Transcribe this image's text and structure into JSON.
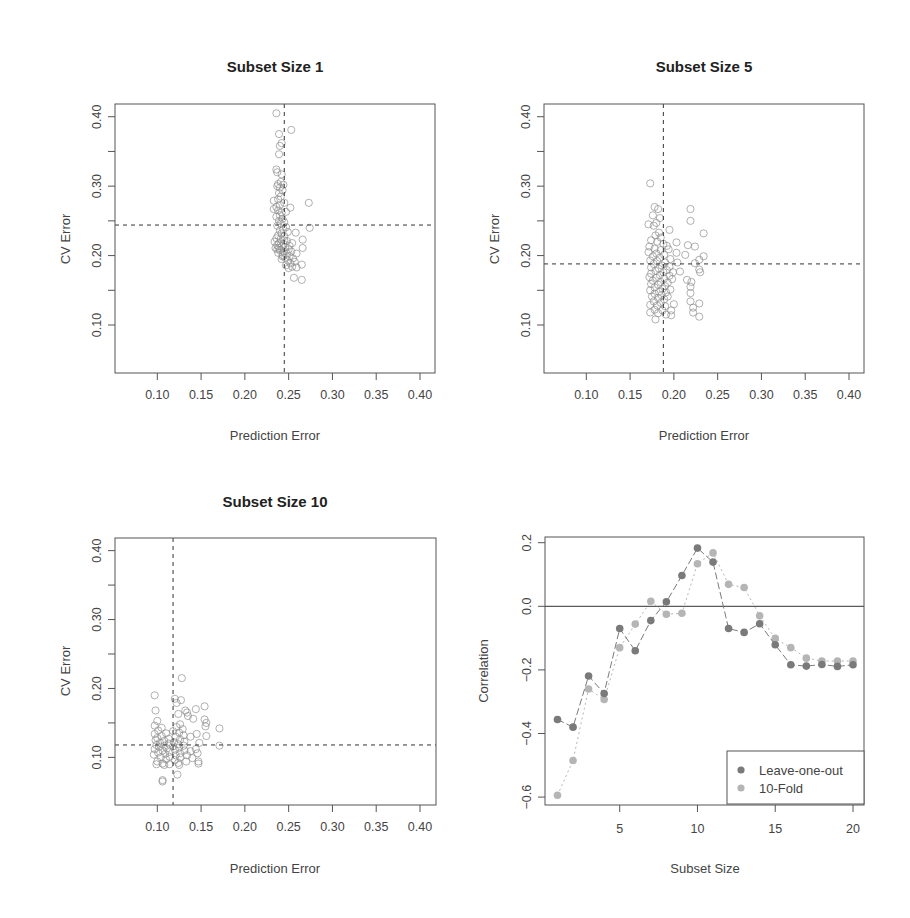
{
  "chart_data": [
    {
      "type": "scatter",
      "title": "Subset Size 1",
      "xlabel": "Prediction Error",
      "ylabel": "CV Error",
      "xlim": [
        0.05,
        0.42
      ],
      "ylim": [
        0.05,
        0.42
      ],
      "xticks": [
        "0.10",
        "0.15",
        "0.20",
        "0.25",
        "0.30",
        "0.35",
        "0.40"
      ],
      "yticks": [
        "0.10",
        "0.20",
        "0.30",
        "0.40"
      ],
      "grid": false,
      "marker": "open-circle",
      "reference_lines": {
        "vertical": 0.245,
        "horizontal": 0.244,
        "style": "dashed"
      },
      "cluster": {
        "x_center": 0.243,
        "y_range": [
          0.16,
          0.405
        ],
        "note": "~100 points concentrated near x=0.24-0.26"
      },
      "points": [
        [
          0.236,
          0.405
        ],
        [
          0.253,
          0.381
        ],
        [
          0.239,
          0.375
        ],
        [
          0.242,
          0.362
        ],
        [
          0.24,
          0.358
        ],
        [
          0.239,
          0.346
        ],
        [
          0.236,
          0.324
        ],
        [
          0.237,
          0.32
        ],
        [
          0.242,
          0.317
        ],
        [
          0.241,
          0.306
        ],
        [
          0.238,
          0.303
        ],
        [
          0.244,
          0.302
        ],
        [
          0.237,
          0.3
        ],
        [
          0.24,
          0.298
        ],
        [
          0.243,
          0.294
        ],
        [
          0.239,
          0.29
        ],
        [
          0.241,
          0.285
        ],
        [
          0.238,
          0.281
        ],
        [
          0.233,
          0.279
        ],
        [
          0.273,
          0.276
        ],
        [
          0.245,
          0.276
        ],
        [
          0.24,
          0.273
        ],
        [
          0.236,
          0.27
        ],
        [
          0.252,
          0.269
        ],
        [
          0.233,
          0.267
        ],
        [
          0.238,
          0.265
        ],
        [
          0.242,
          0.262
        ],
        [
          0.247,
          0.263
        ],
        [
          0.24,
          0.258
        ],
        [
          0.236,
          0.256
        ],
        [
          0.243,
          0.253
        ],
        [
          0.239,
          0.25
        ],
        [
          0.245,
          0.248
        ],
        [
          0.241,
          0.246
        ],
        [
          0.237,
          0.243
        ],
        [
          0.247,
          0.241
        ],
        [
          0.274,
          0.24
        ],
        [
          0.244,
          0.238
        ],
        [
          0.24,
          0.236
        ],
        [
          0.258,
          0.233
        ],
        [
          0.249,
          0.234
        ],
        [
          0.242,
          0.232
        ],
        [
          0.238,
          0.229
        ],
        [
          0.245,
          0.228
        ],
        [
          0.236,
          0.225
        ],
        [
          0.241,
          0.224
        ],
        [
          0.266,
          0.223
        ],
        [
          0.248,
          0.221
        ],
        [
          0.234,
          0.22
        ],
        [
          0.239,
          0.218
        ],
        [
          0.244,
          0.217
        ],
        [
          0.254,
          0.218
        ],
        [
          0.237,
          0.215
        ],
        [
          0.242,
          0.213
        ],
        [
          0.246,
          0.212
        ],
        [
          0.266,
          0.211
        ],
        [
          0.235,
          0.211
        ],
        [
          0.25,
          0.209
        ],
        [
          0.24,
          0.208
        ],
        [
          0.244,
          0.206
        ],
        [
          0.253,
          0.206
        ],
        [
          0.238,
          0.204
        ],
        [
          0.248,
          0.203
        ],
        [
          0.259,
          0.203
        ],
        [
          0.243,
          0.201
        ],
        [
          0.251,
          0.199
        ],
        [
          0.246,
          0.197
        ],
        [
          0.255,
          0.196
        ],
        [
          0.242,
          0.195
        ],
        [
          0.249,
          0.193
        ],
        [
          0.257,
          0.191
        ],
        [
          0.252,
          0.189
        ],
        [
          0.265,
          0.187
        ],
        [
          0.247,
          0.186
        ],
        [
          0.254,
          0.184
        ],
        [
          0.259,
          0.183
        ],
        [
          0.25,
          0.182
        ],
        [
          0.256,
          0.168
        ],
        [
          0.265,
          0.165
        ],
        [
          0.245,
          0.222
        ],
        [
          0.239,
          0.211
        ],
        [
          0.251,
          0.214
        ],
        [
          0.237,
          0.209
        ],
        [
          0.243,
          0.199
        ]
      ]
    },
    {
      "type": "scatter",
      "title": "Subset Size 5",
      "xlabel": "Prediction Error",
      "ylabel": "CV Error",
      "xlim": [
        0.05,
        0.42
      ],
      "ylim": [
        0.05,
        0.42
      ],
      "xticks": [
        "0.10",
        "0.15",
        "0.20",
        "0.25",
        "0.30",
        "0.35",
        "0.40"
      ],
      "yticks": [
        "0.10",
        "0.20",
        "0.30",
        "0.40"
      ],
      "grid": false,
      "marker": "open-circle",
      "reference_lines": {
        "vertical": 0.188,
        "horizontal": 0.188,
        "style": "dashed"
      },
      "cluster": {
        "x_range": [
          0.17,
          0.235
        ],
        "y_range": [
          0.108,
          0.304
        ]
      },
      "points": [
        [
          0.173,
          0.304
        ],
        [
          0.178,
          0.27
        ],
        [
          0.182,
          0.267
        ],
        [
          0.219,
          0.267
        ],
        [
          0.176,
          0.258
        ],
        [
          0.184,
          0.254
        ],
        [
          0.219,
          0.25
        ],
        [
          0.171,
          0.245
        ],
        [
          0.18,
          0.247
        ],
        [
          0.177,
          0.243
        ],
        [
          0.195,
          0.237
        ],
        [
          0.183,
          0.233
        ],
        [
          0.234,
          0.232
        ],
        [
          0.179,
          0.229
        ],
        [
          0.185,
          0.226
        ],
        [
          0.174,
          0.222
        ],
        [
          0.181,
          0.22
        ],
        [
          0.203,
          0.219
        ],
        [
          0.188,
          0.217
        ],
        [
          0.216,
          0.215
        ],
        [
          0.224,
          0.213
        ],
        [
          0.172,
          0.213
        ],
        [
          0.192,
          0.214
        ],
        [
          0.178,
          0.21
        ],
        [
          0.185,
          0.208
        ],
        [
          0.194,
          0.209
        ],
        [
          0.171,
          0.205
        ],
        [
          0.203,
          0.204
        ],
        [
          0.18,
          0.203
        ],
        [
          0.189,
          0.201
        ],
        [
          0.213,
          0.201
        ],
        [
          0.176,
          0.199
        ],
        [
          0.234,
          0.199
        ],
        [
          0.184,
          0.197
        ],
        [
          0.196,
          0.195
        ],
        [
          0.173,
          0.193
        ],
        [
          0.229,
          0.194
        ],
        [
          0.181,
          0.192
        ],
        [
          0.19,
          0.19
        ],
        [
          0.204,
          0.19
        ],
        [
          0.177,
          0.188
        ],
        [
          0.224,
          0.189
        ],
        [
          0.186,
          0.186
        ],
        [
          0.195,
          0.184
        ],
        [
          0.174,
          0.183
        ],
        [
          0.183,
          0.181
        ],
        [
          0.192,
          0.179
        ],
        [
          0.229,
          0.18
        ],
        [
          0.179,
          0.178
        ],
        [
          0.207,
          0.177
        ],
        [
          0.188,
          0.176
        ],
        [
          0.199,
          0.176
        ],
        [
          0.23,
          0.176
        ],
        [
          0.174,
          0.174
        ],
        [
          0.184,
          0.172
        ],
        [
          0.195,
          0.171
        ],
        [
          0.172,
          0.169
        ],
        [
          0.18,
          0.168
        ],
        [
          0.189,
          0.167
        ],
        [
          0.198,
          0.166
        ],
        [
          0.215,
          0.165
        ],
        [
          0.176,
          0.164
        ],
        [
          0.185,
          0.162
        ],
        [
          0.22,
          0.162
        ],
        [
          0.193,
          0.161
        ],
        [
          0.174,
          0.159
        ],
        [
          0.182,
          0.158
        ],
        [
          0.19,
          0.156
        ],
        [
          0.219,
          0.155
        ],
        [
          0.178,
          0.154
        ],
        [
          0.187,
          0.152
        ],
        [
          0.196,
          0.151
        ],
        [
          0.173,
          0.15
        ],
        [
          0.183,
          0.148
        ],
        [
          0.191,
          0.147
        ],
        [
          0.219,
          0.146
        ],
        [
          0.178,
          0.145
        ],
        [
          0.186,
          0.143
        ],
        [
          0.175,
          0.141
        ],
        [
          0.193,
          0.141
        ],
        [
          0.182,
          0.139
        ],
        [
          0.189,
          0.137
        ],
        [
          0.219,
          0.134
        ],
        [
          0.177,
          0.134
        ],
        [
          0.185,
          0.132
        ],
        [
          0.2,
          0.13
        ],
        [
          0.229,
          0.131
        ],
        [
          0.173,
          0.129
        ],
        [
          0.181,
          0.128
        ],
        [
          0.19,
          0.127
        ],
        [
          0.222,
          0.125
        ],
        [
          0.178,
          0.122
        ],
        [
          0.187,
          0.121
        ],
        [
          0.197,
          0.121
        ],
        [
          0.173,
          0.118
        ],
        [
          0.222,
          0.118
        ],
        [
          0.182,
          0.117
        ],
        [
          0.191,
          0.115
        ],
        [
          0.197,
          0.114
        ],
        [
          0.229,
          0.112
        ],
        [
          0.179,
          0.108
        ]
      ]
    },
    {
      "type": "scatter",
      "title": "Subset Size 10",
      "xlabel": "Prediction Error",
      "ylabel": "CV Error",
      "xlim": [
        0.05,
        0.42
      ],
      "ylim": [
        0.05,
        0.42
      ],
      "xticks": [
        "0.10",
        "0.15",
        "0.20",
        "0.25",
        "0.30",
        "0.35",
        "0.40"
      ],
      "yticks": [
        "0.10",
        "0.20",
        "0.30",
        "0.40"
      ],
      "grid": false,
      "marker": "open-circle",
      "reference_lines": {
        "vertical": 0.118,
        "horizontal": 0.118,
        "style": "dashed"
      },
      "cluster": {
        "x_range": [
          0.095,
          0.172
        ],
        "y_range": [
          0.065,
          0.215
        ]
      },
      "points": [
        [
          0.128,
          0.215
        ],
        [
          0.097,
          0.19
        ],
        [
          0.12,
          0.185
        ],
        [
          0.127,
          0.183
        ],
        [
          0.122,
          0.179
        ],
        [
          0.154,
          0.174
        ],
        [
          0.144,
          0.17
        ],
        [
          0.132,
          0.168
        ],
        [
          0.098,
          0.168
        ],
        [
          0.134,
          0.165
        ],
        [
          0.124,
          0.163
        ],
        [
          0.135,
          0.16
        ],
        [
          0.141,
          0.156
        ],
        [
          0.154,
          0.155
        ],
        [
          0.1,
          0.153
        ],
        [
          0.156,
          0.15
        ],
        [
          0.126,
          0.148
        ],
        [
          0.097,
          0.146
        ],
        [
          0.155,
          0.145
        ],
        [
          0.122,
          0.144
        ],
        [
          0.105,
          0.143
        ],
        [
          0.171,
          0.142
        ],
        [
          0.129,
          0.141
        ],
        [
          0.101,
          0.139
        ],
        [
          0.118,
          0.138
        ],
        [
          0.125,
          0.136
        ],
        [
          0.11,
          0.135
        ],
        [
          0.097,
          0.134
        ],
        [
          0.145,
          0.134
        ],
        [
          0.13,
          0.132
        ],
        [
          0.105,
          0.131
        ],
        [
          0.156,
          0.131
        ],
        [
          0.121,
          0.13
        ],
        [
          0.138,
          0.13
        ],
        [
          0.1,
          0.128
        ],
        [
          0.113,
          0.127
        ],
        [
          0.126,
          0.126
        ],
        [
          0.098,
          0.125
        ],
        [
          0.108,
          0.124
        ],
        [
          0.131,
          0.123
        ],
        [
          0.119,
          0.122
        ],
        [
          0.103,
          0.121
        ],
        [
          0.148,
          0.121
        ],
        [
          0.113,
          0.12
        ],
        [
          0.124,
          0.119
        ],
        [
          0.099,
          0.118
        ],
        [
          0.108,
          0.117
        ],
        [
          0.13,
          0.117
        ],
        [
          0.171,
          0.117
        ],
        [
          0.118,
          0.116
        ],
        [
          0.102,
          0.115
        ],
        [
          0.125,
          0.114
        ],
        [
          0.111,
          0.113
        ],
        [
          0.144,
          0.112
        ],
        [
          0.097,
          0.112
        ],
        [
          0.12,
          0.111
        ],
        [
          0.106,
          0.11
        ],
        [
          0.131,
          0.11
        ],
        [
          0.138,
          0.109
        ],
        [
          0.114,
          0.108
        ],
        [
          0.101,
          0.107
        ],
        [
          0.126,
          0.106
        ],
        [
          0.146,
          0.106
        ],
        [
          0.109,
          0.105
        ],
        [
          0.096,
          0.104
        ],
        [
          0.121,
          0.103
        ],
        [
          0.134,
          0.103
        ],
        [
          0.114,
          0.101
        ],
        [
          0.104,
          0.1
        ],
        [
          0.126,
          0.1
        ],
        [
          0.14,
          0.099
        ],
        [
          0.11,
          0.097
        ],
        [
          0.12,
          0.096
        ],
        [
          0.1,
          0.094
        ],
        [
          0.133,
          0.094
        ],
        [
          0.147,
          0.094
        ],
        [
          0.124,
          0.092
        ],
        [
          0.106,
          0.091
        ],
        [
          0.099,
          0.09
        ],
        [
          0.114,
          0.09
        ],
        [
          0.147,
          0.091
        ],
        [
          0.125,
          0.089
        ],
        [
          0.108,
          0.089
        ],
        [
          0.123,
          0.075
        ],
        [
          0.106,
          0.067
        ],
        [
          0.106,
          0.065
        ]
      ]
    },
    {
      "type": "line",
      "title": "",
      "xlabel": "Subset Size",
      "ylabel": "Correlation",
      "xlim": [
        0.5,
        20.7
      ],
      "ylim": [
        -0.62,
        0.22
      ],
      "xticks": [
        "5",
        "10",
        "15",
        "20"
      ],
      "yticks": [
        "-0.6",
        "-0.4",
        "-0.2",
        "0.0",
        "0.2"
      ],
      "grid": false,
      "reference_lines": {
        "horizontal": 0.0,
        "style": "solid"
      },
      "legend_position": "bottom-right",
      "x": [
        1,
        2,
        3,
        4,
        5,
        6,
        7,
        8,
        9,
        10,
        11,
        12,
        13,
        14,
        15,
        16,
        17,
        18,
        19,
        20
      ],
      "series": [
        {
          "name": "Leave-one-out",
          "color": "#7a7a7a",
          "line_style": "dashed-long",
          "values": [
            -0.356,
            -0.38,
            -0.219,
            -0.274,
            -0.07,
            -0.14,
            -0.045,
            0.014,
            0.097,
            0.183,
            0.139,
            -0.07,
            -0.082,
            -0.055,
            -0.121,
            -0.184,
            -0.188,
            -0.183,
            -0.189,
            -0.184
          ]
        },
        {
          "name": "10-Fold",
          "color": "#b5b5b5",
          "line_style": "dotted",
          "values": [
            -0.594,
            -0.485,
            -0.26,
            -0.293,
            -0.13,
            -0.056,
            0.016,
            -0.025,
            -0.022,
            0.134,
            0.168,
            0.069,
            0.059,
            -0.03,
            -0.101,
            -0.13,
            -0.163,
            -0.172,
            -0.172,
            -0.172
          ]
        }
      ]
    }
  ],
  "panels": [
    {
      "title": "Subset Size 1",
      "xlabel": "Prediction Error",
      "ylabel": "CV Error"
    },
    {
      "title": "Subset Size 5",
      "xlabel": "Prediction Error",
      "ylabel": "CV Error"
    },
    {
      "title": "Subset Size 10",
      "xlabel": "Prediction Error",
      "ylabel": "CV Error"
    },
    {
      "title": "",
      "xlabel": "Subset Size",
      "ylabel": "Correlation"
    }
  ],
  "legend": {
    "items": [
      {
        "label": "Leave-one-out"
      },
      {
        "label": "10-Fold"
      }
    ]
  },
  "colors": {
    "frame": "#555555",
    "point_stroke": "#8a8a8a",
    "reference_line": "#333333",
    "text": "#444444"
  }
}
